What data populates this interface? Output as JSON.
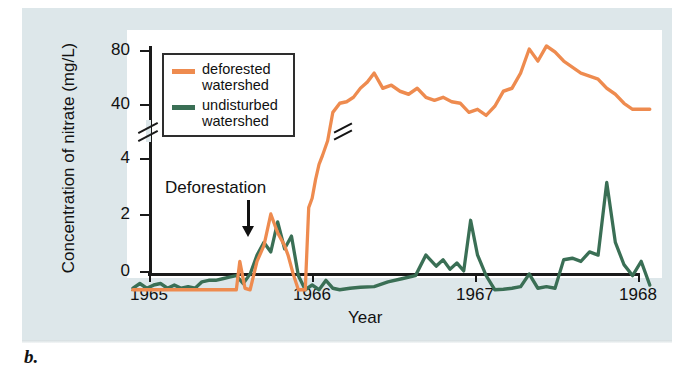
{
  "figure": {
    "caption_label": "b.",
    "annotation": {
      "text": "Deforestation",
      "arrow_icon": "down-arrow-icon",
      "x_value": 1965.62
    }
  },
  "legend": {
    "position": "top-left-inside",
    "entries": [
      {
        "label_line1": "deforested",
        "label_line2": "watershed",
        "color": "#ee8b4f"
      },
      {
        "label_line1": "undisturbed",
        "label_line2": "watershed",
        "color": "#3a6f55"
      }
    ]
  },
  "axes": {
    "y": {
      "title": "Concentration of nitrate (mg/L)",
      "ticks": [
        "0",
        "2",
        "4",
        "40",
        "80"
      ],
      "break_between": [
        "4",
        "40"
      ],
      "has_break": true
    },
    "x": {
      "title": "Year",
      "ticks": [
        "1965",
        "1966",
        "1967",
        "1968"
      ]
    }
  },
  "chart_data": {
    "type": "line",
    "xlabel": "Year",
    "ylabel": "Concentration of nitrate (mg/L)",
    "xlim": [
      1965.0,
      1968.0
    ],
    "ylim": [
      0,
      80
    ],
    "y_axis_broken": true,
    "y_break_range": [
      5,
      30
    ],
    "y_ticks": [
      0,
      2,
      4,
      40,
      80
    ],
    "x_ticks": [
      1965,
      1966,
      1967,
      1968
    ],
    "grid": false,
    "legend_position": "upper left",
    "annotations": [
      {
        "text": "Deforestation",
        "x": 1965.62,
        "y": 1.0,
        "arrow": "down"
      }
    ],
    "series": [
      {
        "name": "deforested watershed",
        "color": "#ee8b4f",
        "x": [
          1965.0,
          1965.05,
          1965.1,
          1965.15,
          1965.2,
          1965.25,
          1965.3,
          1965.35,
          1965.4,
          1965.45,
          1965.5,
          1965.55,
          1965.6,
          1965.62,
          1965.65,
          1965.68,
          1965.72,
          1965.76,
          1965.8,
          1965.84,
          1965.88,
          1965.9,
          1965.93,
          1965.96,
          1966.0,
          1966.02,
          1966.04,
          1966.06,
          1966.08,
          1966.1,
          1966.13,
          1966.16,
          1966.2,
          1966.24,
          1966.28,
          1966.32,
          1966.36,
          1966.4,
          1966.45,
          1966.5,
          1966.55,
          1966.6,
          1966.65,
          1966.7,
          1966.75,
          1966.8,
          1966.85,
          1966.9,
          1966.95,
          1967.0,
          1967.05,
          1967.1,
          1967.15,
          1967.2,
          1967.25,
          1967.3,
          1967.35,
          1967.4,
          1967.45,
          1967.5,
          1967.55,
          1967.6,
          1967.65,
          1967.7,
          1967.75,
          1967.8,
          1967.85,
          1967.9,
          1967.95,
          1968.0
        ],
        "y": [
          0.1,
          0.1,
          0.1,
          0.1,
          0.1,
          0.1,
          0.1,
          0.1,
          0.1,
          0.1,
          0.1,
          0.1,
          0.1,
          1.0,
          0.15,
          0.1,
          1.0,
          1.5,
          2.5,
          1.9,
          1.5,
          1.2,
          0.6,
          0.1,
          0.1,
          2.7,
          3.0,
          3.6,
          4.2,
          5.0,
          20.0,
          36.0,
          42.0,
          43.0,
          46.0,
          52.0,
          56.0,
          62.0,
          52.0,
          54.0,
          50.0,
          48.0,
          52.0,
          46.0,
          44.0,
          46.0,
          43.0,
          42.0,
          36.0,
          38.0,
          34.0,
          40.0,
          50.0,
          52.0,
          62.0,
          78.0,
          70.0,
          80.0,
          76.0,
          70.0,
          66.0,
          62.0,
          60.0,
          58.0,
          52.0,
          48.0,
          42.0,
          38.0,
          38.0,
          38.0
        ]
      },
      {
        "name": "undisturbed watershed",
        "color": "#3a6f55",
        "x": [
          1965.0,
          1965.04,
          1965.08,
          1965.12,
          1965.16,
          1965.2,
          1965.24,
          1965.28,
          1965.32,
          1965.36,
          1965.4,
          1965.44,
          1965.48,
          1965.52,
          1965.56,
          1965.6,
          1965.64,
          1965.68,
          1965.72,
          1965.76,
          1965.8,
          1965.84,
          1965.88,
          1965.92,
          1965.96,
          1966.0,
          1966.04,
          1966.08,
          1966.12,
          1966.16,
          1966.2,
          1966.26,
          1966.32,
          1966.4,
          1966.48,
          1966.56,
          1966.64,
          1966.7,
          1966.76,
          1966.8,
          1966.84,
          1966.88,
          1966.92,
          1966.96,
          1967.0,
          1967.05,
          1967.1,
          1967.15,
          1967.2,
          1967.25,
          1967.3,
          1967.35,
          1967.4,
          1967.45,
          1967.5,
          1967.55,
          1967.6,
          1967.65,
          1967.7,
          1967.75,
          1967.8,
          1967.85,
          1967.9,
          1967.95,
          1968.0
        ],
        "y": [
          0.15,
          0.3,
          0.15,
          0.25,
          0.3,
          0.15,
          0.25,
          0.15,
          0.2,
          0.15,
          0.35,
          0.4,
          0.4,
          0.45,
          0.5,
          0.55,
          0.3,
          0.6,
          1.2,
          1.6,
          1.3,
          2.25,
          1.4,
          1.8,
          0.55,
          0.1,
          0.25,
          0.1,
          0.4,
          0.15,
          0.1,
          0.15,
          0.18,
          0.2,
          0.35,
          0.45,
          0.55,
          1.2,
          0.85,
          1.05,
          0.75,
          0.95,
          0.7,
          2.3,
          1.2,
          0.55,
          0.1,
          0.12,
          0.15,
          0.2,
          0.6,
          0.15,
          0.2,
          0.15,
          1.05,
          1.1,
          1.0,
          1.3,
          1.2,
          3.5,
          1.6,
          0.9,
          0.55,
          1.0,
          0.25
        ]
      }
    ]
  }
}
